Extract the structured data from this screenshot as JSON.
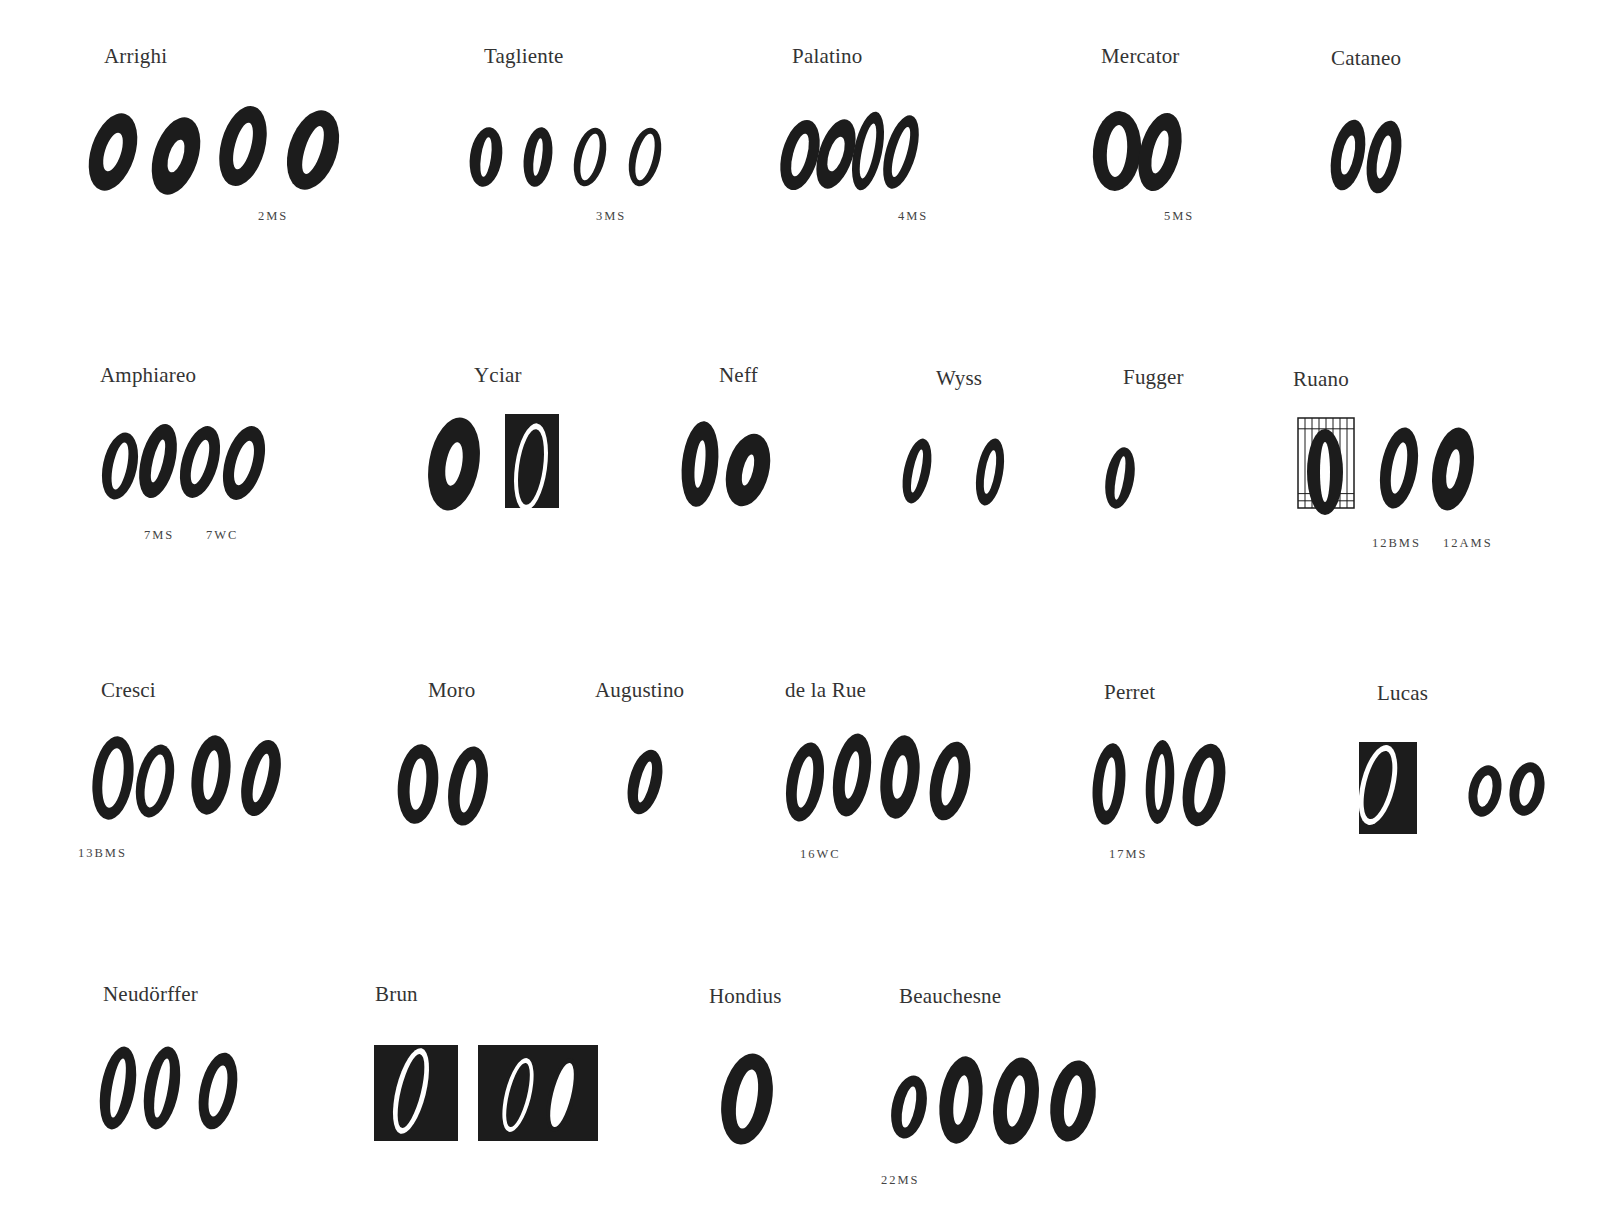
{
  "page": {
    "specimens": [
      {
        "name": "Arrighi",
        "x": 104,
        "y": 44,
        "sources": [
          {
            "label": "2MS",
            "x": 258,
            "y": 219
          }
        ],
        "glyphs": [
          {
            "cx": 113,
            "cy": 152,
            "rx": 22,
            "ry": 40,
            "rot": 18,
            "hole": [
              8,
              20
            ],
            "box": null
          },
          {
            "cx": 176,
            "cy": 156,
            "rx": 22,
            "ry": 40,
            "rot": 18,
            "hole": [
              7,
              17
            ],
            "box": null
          },
          {
            "cx": 243,
            "cy": 146,
            "rx": 22,
            "ry": 41,
            "rot": 15,
            "hole": [
              8,
              24
            ],
            "box": null
          },
          {
            "cx": 313,
            "cy": 150,
            "rx": 24,
            "ry": 41,
            "rot": 18,
            "hole": [
              8,
              25
            ],
            "box": null
          }
        ]
      },
      {
        "name": "Tagliente",
        "x": 484,
        "y": 44,
        "sources": [
          {
            "label": "3MS",
            "x": 596,
            "y": 219
          }
        ],
        "glyphs": [
          {
            "cx": 486,
            "cy": 157,
            "rx": 16,
            "ry": 30,
            "rot": 8,
            "hole": [
              5,
              20
            ],
            "box": null
          },
          {
            "cx": 538,
            "cy": 157,
            "rx": 14,
            "ry": 30,
            "rot": 8,
            "hole": [
              4,
              19
            ],
            "box": null
          },
          {
            "cx": 590,
            "cy": 157,
            "rx": 15,
            "ry": 30,
            "rot": 14,
            "hole": [
              8,
              24
            ],
            "box": null
          },
          {
            "cx": 645,
            "cy": 157,
            "rx": 15,
            "ry": 30,
            "rot": 14,
            "hole": [
              8,
              24
            ],
            "box": null
          }
        ]
      },
      {
        "name": "Palatino",
        "x": 792,
        "y": 44,
        "sources": [
          {
            "label": "4MS",
            "x": 898,
            "y": 219
          }
        ],
        "glyphs": [
          {
            "cx": 800,
            "cy": 155,
            "rx": 18,
            "ry": 36,
            "rot": 15,
            "hole": [
              7,
              22
            ],
            "box": null
          },
          {
            "cx": 836,
            "cy": 154,
            "rx": 17,
            "ry": 36,
            "rot": 18,
            "hole": [
              7,
              18
            ],
            "box": null
          },
          {
            "cx": 868,
            "cy": 151,
            "rx": 14,
            "ry": 40,
            "rot": 12,
            "hole": [
              6,
              28
            ],
            "box": null
          },
          {
            "cx": 901,
            "cy": 152,
            "rx": 15,
            "ry": 38,
            "rot": 16,
            "hole": [
              6,
              26
            ],
            "box": null
          }
        ]
      },
      {
        "name": "Mercator",
        "x": 1101,
        "y": 44,
        "sources": [
          {
            "label": "5MS",
            "x": 1164,
            "y": 219
          }
        ],
        "glyphs": [
          {
            "cx": 1117,
            "cy": 151,
            "rx": 24,
            "ry": 40,
            "rot": 5,
            "hole": [
              10,
              26
            ],
            "box": null
          },
          {
            "cx": 1160,
            "cy": 152,
            "rx": 20,
            "ry": 40,
            "rot": 14,
            "hole": [
              7,
              22
            ],
            "box": null
          }
        ]
      },
      {
        "name": "Cataneo",
        "x": 1331,
        "y": 46,
        "sources": [],
        "glyphs": [
          {
            "cx": 1348,
            "cy": 155,
            "rx": 16,
            "ry": 36,
            "rot": 12,
            "hole": [
              6,
              20
            ],
            "box": null
          },
          {
            "cx": 1384,
            "cy": 157,
            "rx": 16,
            "ry": 37,
            "rot": 12,
            "hole": [
              6,
              22
            ],
            "box": null
          }
        ]
      },
      {
        "name": "Amphiareo",
        "x": 100,
        "y": 363,
        "sources": [
          {
            "label": "7MS",
            "x": 144,
            "y": 538
          },
          {
            "label": "7WC",
            "x": 206,
            "y": 538
          }
        ],
        "glyphs": [
          {
            "cx": 120,
            "cy": 466,
            "rx": 17,
            "ry": 34,
            "rot": 12,
            "hole": [
              7,
              24
            ],
            "box": null
          },
          {
            "cx": 158,
            "cy": 461,
            "rx": 17,
            "ry": 38,
            "rot": 14,
            "hole": [
              5,
              22
            ],
            "box": null
          },
          {
            "cx": 200,
            "cy": 462,
            "rx": 18,
            "ry": 37,
            "rot": 16,
            "hole": [
              7,
              23
            ],
            "box": null
          },
          {
            "cx": 244,
            "cy": 463,
            "rx": 19,
            "ry": 38,
            "rot": 16,
            "hole": [
              8,
              23
            ],
            "box": null
          }
        ]
      },
      {
        "name": "Yciar",
        "x": 474,
        "y": 363,
        "sources": [],
        "glyphs": [
          {
            "cx": 454,
            "cy": 464,
            "rx": 25,
            "ry": 47,
            "rot": 10,
            "hole": [
              8,
              22
            ],
            "box": null
          },
          {
            "cx": 531,
            "cy": 467,
            "rx": 16,
            "ry": 44,
            "rot": 8,
            "hole": [
              12,
              38
            ],
            "box": [
              505,
              414,
              54,
              94
            ]
          }
        ]
      },
      {
        "name": "Neff",
        "x": 719,
        "y": 363,
        "sources": [],
        "glyphs": [
          {
            "cx": 700,
            "cy": 464,
            "rx": 18,
            "ry": 43,
            "rot": 6,
            "hole": [
              5,
              24
            ],
            "box": null
          },
          {
            "cx": 748,
            "cy": 470,
            "rx": 21,
            "ry": 37,
            "rot": 14,
            "hole": [
              5,
              16
            ],
            "box": null
          }
        ]
      },
      {
        "name": "Wyss",
        "x": 936,
        "y": 366,
        "sources": [],
        "glyphs": [
          {
            "cx": 917,
            "cy": 471,
            "rx": 13,
            "ry": 33,
            "rot": 12,
            "hole": [
              4,
              22
            ],
            "box": null
          },
          {
            "cx": 990,
            "cy": 472,
            "rx": 13,
            "ry": 34,
            "rot": 10,
            "hole": [
              5,
              22
            ],
            "box": null
          }
        ]
      },
      {
        "name": "Fugger",
        "x": 1123,
        "y": 365,
        "sources": [],
        "glyphs": [
          {
            "cx": 1120,
            "cy": 478,
            "rx": 14,
            "ry": 31,
            "rot": 10,
            "hole": [
              4,
              22
            ],
            "box": null
          }
        ]
      },
      {
        "name": "Ruano",
        "x": 1293,
        "y": 367,
        "sources": [
          {
            "label": "12BMS",
            "x": 1372,
            "y": 546
          },
          {
            "label": "12AMS",
            "x": 1443,
            "y": 546
          }
        ],
        "glyphs": [
          {
            "cx": 1325,
            "cy": 472,
            "rx": 18,
            "ry": 43,
            "rot": 0,
            "hole": [
              5,
              30
            ],
            "box": [
              1298,
              418,
              56,
              90
            ],
            "grid": true
          },
          {
            "cx": 1399,
            "cy": 468,
            "rx": 18,
            "ry": 41,
            "rot": 10,
            "hole": [
              7,
              26
            ],
            "box": null
          },
          {
            "cx": 1453,
            "cy": 469,
            "rx": 20,
            "ry": 42,
            "rot": 10,
            "hole": [
              6,
              20
            ],
            "box": null
          }
        ]
      },
      {
        "name": "Cresci",
        "x": 101,
        "y": 678,
        "sources": [
          {
            "label": "13BMS",
            "x": 78,
            "y": 856
          }
        ],
        "glyphs": [
          {
            "cx": 113,
            "cy": 778,
            "rx": 20,
            "ry": 42,
            "rot": 8,
            "hole": [
              10,
              30
            ],
            "box": null
          },
          {
            "cx": 155,
            "cy": 781,
            "rx": 18,
            "ry": 37,
            "rot": 12,
            "hole": [
              9,
              27
            ],
            "box": null
          },
          {
            "cx": 211,
            "cy": 775,
            "rx": 19,
            "ry": 40,
            "rot": 8,
            "hole": [
              7,
              25
            ],
            "box": null
          },
          {
            "cx": 261,
            "cy": 778,
            "rx": 18,
            "ry": 39,
            "rot": 14,
            "hole": [
              6,
              25
            ],
            "box": null
          }
        ]
      },
      {
        "name": "Moro",
        "x": 428,
        "y": 678,
        "sources": [],
        "glyphs": [
          {
            "cx": 418,
            "cy": 784,
            "rx": 20,
            "ry": 40,
            "rot": 6,
            "hole": [
              8,
              26
            ],
            "box": null
          },
          {
            "cx": 468,
            "cy": 786,
            "rx": 19,
            "ry": 40,
            "rot": 10,
            "hole": [
              7,
              27
            ],
            "box": null
          }
        ]
      },
      {
        "name": "Augustino",
        "x": 595,
        "y": 678,
        "sources": [],
        "glyphs": [
          {
            "cx": 645,
            "cy": 782,
            "rx": 16,
            "ry": 33,
            "rot": 14,
            "hole": [
              5,
              21
            ],
            "box": null
          }
        ]
      },
      {
        "name": "de la Rue",
        "x": 785,
        "y": 678,
        "sources": [
          {
            "label": "16WC",
            "x": 800,
            "y": 857
          }
        ],
        "glyphs": [
          {
            "cx": 805,
            "cy": 782,
            "rx": 18,
            "ry": 40,
            "rot": 10,
            "hole": [
              7,
              26
            ],
            "box": null
          },
          {
            "cx": 852,
            "cy": 775,
            "rx": 18,
            "ry": 42,
            "rot": 10,
            "hole": [
              6,
              24
            ],
            "box": null
          },
          {
            "cx": 900,
            "cy": 777,
            "rx": 19,
            "ry": 42,
            "rot": 8,
            "hole": [
              7,
              22
            ],
            "box": null
          },
          {
            "cx": 950,
            "cy": 781,
            "rx": 19,
            "ry": 40,
            "rot": 12,
            "hole": [
              7,
              25
            ],
            "box": null
          }
        ]
      },
      {
        "name": "Perret",
        "x": 1104,
        "y": 680,
        "sources": [
          {
            "label": "17MS",
            "x": 1109,
            "y": 857
          }
        ],
        "glyphs": [
          {
            "cx": 1109,
            "cy": 784,
            "rx": 16,
            "ry": 41,
            "rot": 6,
            "hole": [
              6,
              27
            ],
            "box": null
          },
          {
            "cx": 1160,
            "cy": 782,
            "rx": 14,
            "ry": 42,
            "rot": 4,
            "hole": [
              5,
              28
            ],
            "box": null
          },
          {
            "cx": 1204,
            "cy": 785,
            "rx": 20,
            "ry": 42,
            "rot": 12,
            "hole": [
              8,
              28
            ],
            "box": null
          }
        ]
      },
      {
        "name": "Lucas",
        "x": 1377,
        "y": 681,
        "sources": [],
        "glyphs": [
          {
            "cx": 1378,
            "cy": 785,
            "rx": 17,
            "ry": 41,
            "rot": 14,
            "hole": [
              12,
              35
            ],
            "box": [
              1359,
              742,
              58,
              92
            ]
          },
          {
            "cx": 1485,
            "cy": 791,
            "rx": 16,
            "ry": 26,
            "rot": 12,
            "hole": [
              7,
              16
            ],
            "box": null
          },
          {
            "cx": 1527,
            "cy": 789,
            "rx": 17,
            "ry": 27,
            "rot": 12,
            "hole": [
              7,
              17
            ],
            "box": null
          }
        ]
      },
      {
        "name": "Neudörffer",
        "x": 103,
        "y": 982,
        "sources": [],
        "glyphs": [
          {
            "cx": 118,
            "cy": 1088,
            "rx": 17,
            "ry": 42,
            "rot": 10,
            "hole": [
              6,
              30
            ],
            "box": null
          },
          {
            "cx": 162,
            "cy": 1088,
            "rx": 17,
            "ry": 42,
            "rot": 10,
            "hole": [
              6,
              30
            ],
            "box": null
          },
          {
            "cx": 218,
            "cy": 1091,
            "rx": 18,
            "ry": 39,
            "rot": 12,
            "hole": [
              8,
              26
            ],
            "box": null
          }
        ]
      },
      {
        "name": "Brun",
        "x": 375,
        "y": 982,
        "sources": [],
        "glyphs": [
          {
            "cx": 411,
            "cy": 1091,
            "rx": 15,
            "ry": 44,
            "rot": 14,
            "hole": [
              10,
              38
            ],
            "box": [
              374,
              1045,
              84,
              96
            ]
          },
          {
            "cx": 518,
            "cy": 1095,
            "rx": 13,
            "ry": 38,
            "rot": 14,
            "hole": [
              9,
              33
            ],
            "box": [
              478,
              1045,
              120,
              96
            ]
          },
          {
            "cx": 562,
            "cy": 1095,
            "rx": 13,
            "ry": 38,
            "rot": 14,
            "hole": [
              9,
              33
            ],
            "box": null
          }
        ]
      },
      {
        "name": "Hondius",
        "x": 709,
        "y": 984,
        "sources": [],
        "glyphs": [
          {
            "cx": 747,
            "cy": 1099,
            "rx": 25,
            "ry": 46,
            "rot": 10,
            "hole": [
              10,
              30
            ],
            "box": null
          }
        ]
      },
      {
        "name": "Beauchesne",
        "x": 899,
        "y": 984,
        "sources": [
          {
            "label": "22MS",
            "x": 881,
            "y": 1183
          }
        ],
        "glyphs": [
          {
            "cx": 909,
            "cy": 1107,
            "rx": 17,
            "ry": 32,
            "rot": 12,
            "hole": [
              6,
              21
            ],
            "box": null
          },
          {
            "cx": 961,
            "cy": 1100,
            "rx": 21,
            "ry": 44,
            "rot": 8,
            "hole": [
              7,
              25
            ],
            "box": null
          },
          {
            "cx": 1016,
            "cy": 1101,
            "rx": 22,
            "ry": 44,
            "rot": 10,
            "hole": [
              8,
              26
            ],
            "box": null
          },
          {
            "cx": 1073,
            "cy": 1101,
            "rx": 22,
            "ry": 41,
            "rot": 10,
            "hole": [
              8,
              26
            ],
            "box": null
          }
        ]
      }
    ]
  }
}
